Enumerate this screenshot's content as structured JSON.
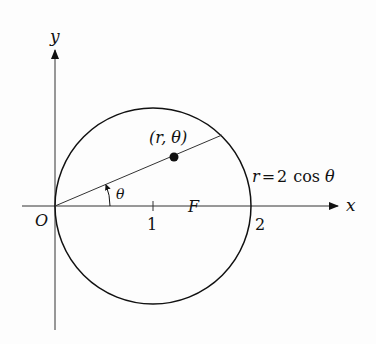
{
  "diagram": {
    "type": "polar-curve",
    "equation_label": "r = 2 cos θ",
    "equation_parts": {
      "lhs": "r",
      "eq": "=",
      "rhs_num": "2",
      "rhs_fn": "cos",
      "rhs_var": "θ"
    },
    "axes": {
      "x_label": "x",
      "y_label": "y",
      "origin_label": "O"
    },
    "ticks": [
      {
        "label": "1",
        "value": 1
      },
      {
        "label": "2",
        "value": 2
      }
    ],
    "point_label": "(r, θ)",
    "angle_label": "θ",
    "focus_label": "F",
    "colors": {
      "stroke": "#111111",
      "background": "#fdfdfd"
    }
  }
}
